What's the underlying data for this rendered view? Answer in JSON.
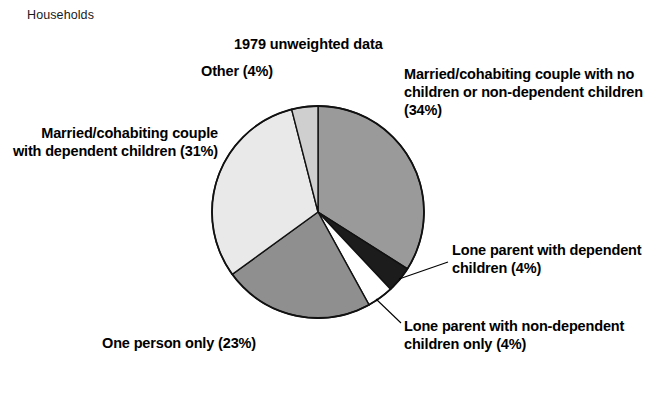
{
  "caption": "Households",
  "chart_title": "1979 unweighted data",
  "labels": {
    "other": "Other (4%)",
    "married_no_children": "Married/cohabiting couple with no children or non-dependent children (34%)",
    "married_dependent": "Married/cohabiting couple with dependent children (31%)",
    "lone_dependent": "Lone parent with dependent children (4%)",
    "lone_non_dependent": "Lone parent with non-dependent children only (4%)",
    "one_person": "One person only (23%)"
  },
  "colors": {
    "married_no_children": "#9a9a9a",
    "lone_dependent": "#1c1c1c",
    "lone_non_dependent": "#ffffff",
    "one_person": "#8f8f8f",
    "married_dependent": "#e9e9e9",
    "other": "#cfcfcf",
    "outline": "#111111"
  },
  "chart_data": {
    "type": "pie",
    "title": "1979 unweighted data",
    "xlabel": "",
    "ylabel": "",
    "unit": "percent",
    "start_angle_deg": 0,
    "direction": "clockwise",
    "categories": [
      "Married/cohabiting couple with no children or non-dependent children",
      "Lone parent with dependent children",
      "Lone parent with non-dependent children only",
      "One person only",
      "Married/cohabiting couple with dependent children",
      "Other"
    ],
    "values": [
      34,
      4,
      4,
      23,
      31,
      4
    ],
    "slices": [
      {
        "label": "Married/cohabiting couple with no children or non-dependent children (34%)",
        "value": 34,
        "color": "#9a9a9a"
      },
      {
        "label": "Lone parent with dependent children (4%)",
        "value": 4,
        "color": "#1c1c1c"
      },
      {
        "label": "Lone parent with non-dependent children only (4%)",
        "value": 4,
        "color": "#ffffff"
      },
      {
        "label": "One person only (23%)",
        "value": 23,
        "color": "#8f8f8f"
      },
      {
        "label": "Married/cohabiting couple with dependent children (31%)",
        "value": 31,
        "color": "#e9e9e9"
      },
      {
        "label": "Other (4%)",
        "value": 4,
        "color": "#cfcfcf"
      }
    ],
    "total": 100,
    "legend": "none",
    "grid": false
  }
}
